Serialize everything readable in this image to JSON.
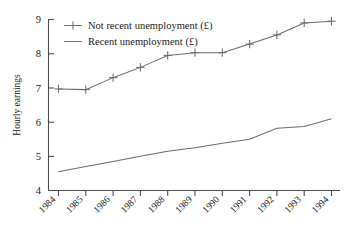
{
  "chart_data": {
    "type": "line",
    "title": "",
    "xlabel": "",
    "ylabel": "Hourly earnings",
    "x": [
      1984,
      1985,
      1986,
      1987,
      1988,
      1989,
      1990,
      1991,
      1992,
      1993,
      1994
    ],
    "categories": [
      "1984",
      "1985",
      "1986",
      "1987",
      "1988",
      "1989",
      "1990",
      "1991",
      "1992",
      "1993",
      "1994"
    ],
    "xlim": [
      1984,
      1994
    ],
    "ylim": [
      4,
      9
    ],
    "yticks": [
      4,
      5,
      6,
      7,
      8,
      9
    ],
    "ytick_labels": [
      "4",
      "5",
      "6",
      "7",
      "8",
      "9"
    ],
    "grid": false,
    "legend_position": "upper-left",
    "series": [
      {
        "name": "Not recent unemployment (£)",
        "marker": "plus",
        "color": "#6b6b6b",
        "values": [
          6.97,
          6.95,
          7.3,
          7.6,
          7.95,
          8.03,
          8.03,
          8.28,
          8.55,
          8.9,
          8.95
        ]
      },
      {
        "name": "Recent unemployment (£)",
        "marker": "none",
        "color": "#6b6b6b",
        "values": [
          4.55,
          4.7,
          4.85,
          5.0,
          5.15,
          5.25,
          5.38,
          5.5,
          5.82,
          5.87,
          6.1
        ]
      }
    ]
  },
  "legend": {
    "entries": [
      {
        "label": "Not recent unemployment (£)",
        "marker": "plus"
      },
      {
        "label": "Recent unemployment (£)",
        "marker": "line"
      }
    ]
  },
  "axes": {
    "y_title": "Hourly earnings",
    "y_labels": [
      "9",
      "8",
      "7",
      "6",
      "5",
      "4"
    ],
    "x_labels": [
      "1984",
      "1985",
      "1986",
      "1987",
      "1988",
      "1989",
      "1990",
      "1991",
      "1992",
      "1993",
      "1994"
    ]
  },
  "colors": {
    "axis": "#4d4d4d",
    "series": "#6b6b6b",
    "text": "#1a1a1a",
    "background": "#ffffff"
  }
}
